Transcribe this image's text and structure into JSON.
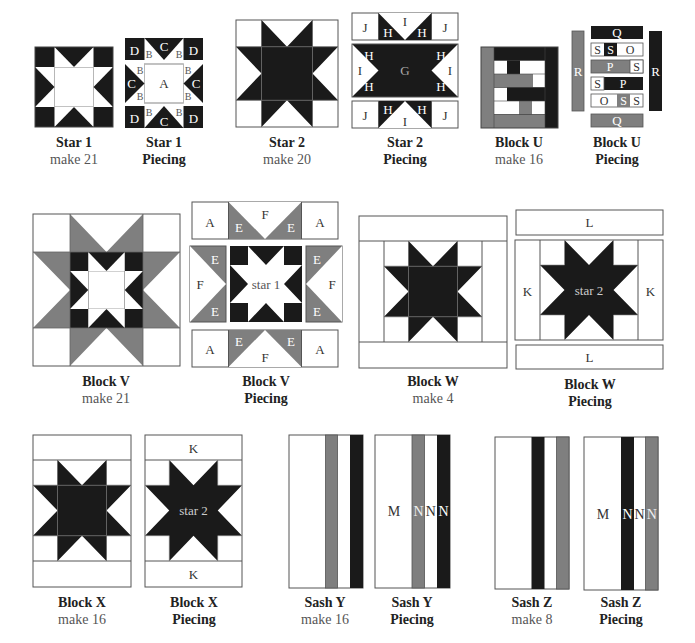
{
  "colors": {
    "dark": "#1a1a1a",
    "gray": "#7f7f7f",
    "light": "#ffffff",
    "stroke": "#666666",
    "text_dark": "#222222",
    "text_gray": "#555555"
  },
  "blocks": [
    {
      "id": "star1",
      "title": "Star 1",
      "subtitle": "make 21"
    },
    {
      "id": "star1p",
      "title": "Star 1",
      "subtitle": "Piecing",
      "labels": {
        "D": "D",
        "C": "C",
        "B": "B",
        "A": "A"
      }
    },
    {
      "id": "star2",
      "title": "Star 2",
      "subtitle": "make 20"
    },
    {
      "id": "star2p",
      "title": "Star 2",
      "subtitle": "Piecing",
      "labels": {
        "J": "J",
        "I": "I",
        "H": "H",
        "G": "G"
      }
    },
    {
      "id": "blocku",
      "title": "Block U",
      "subtitle": "make 16"
    },
    {
      "id": "blockup",
      "title": "Block U",
      "subtitle": "Piecing",
      "labels": {
        "Q": "Q",
        "S": "S",
        "O": "O",
        "P": "P",
        "R": "R"
      }
    },
    {
      "id": "blockv",
      "title": "Block V",
      "subtitle": "make 21"
    },
    {
      "id": "blockvp",
      "title": "Block V",
      "subtitle": "Piecing",
      "labels": {
        "A": "A",
        "E": "E",
        "F": "F",
        "center": "star 1"
      }
    },
    {
      "id": "blockw",
      "title": "Block W",
      "subtitle": "make 4"
    },
    {
      "id": "blockwp",
      "title": "Block W",
      "subtitle": "Piecing",
      "labels": {
        "L": "L",
        "K": "K",
        "center": "star 2"
      }
    },
    {
      "id": "blockx",
      "title": "Block X",
      "subtitle": "make 16"
    },
    {
      "id": "blockxp",
      "title": "Block X",
      "subtitle": "Piecing",
      "labels": {
        "K": "K",
        "center": "star 2"
      }
    },
    {
      "id": "sashy",
      "title": "Sash Y",
      "subtitle": "make 16"
    },
    {
      "id": "sashyp",
      "title": "Sash Y",
      "subtitle": "Piecing",
      "labels": {
        "M": "M",
        "N": "N"
      }
    },
    {
      "id": "sashz",
      "title": "Sash Z",
      "subtitle": "make 8"
    },
    {
      "id": "sashzp",
      "title": "Sash Z",
      "subtitle": "Piecing",
      "labels": {
        "M": "M",
        "N": "N"
      }
    }
  ]
}
